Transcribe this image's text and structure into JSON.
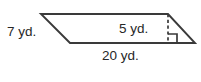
{
  "figure": {
    "kind": "parallelogram-with-height",
    "stroke_color": "#3a3a3a",
    "text_color": "#272727",
    "background_color": "#ffffff",
    "labels": {
      "left_side": "7 yd.",
      "height": "5 yd.",
      "base": "20 yd."
    },
    "icons": {
      "right_angle_marker": "right-angle-icon",
      "height_line": "dashed-height-line-icon"
    },
    "geometry": {
      "top_left": [
        41,
        14
      ],
      "top_right": [
        168,
        14
      ],
      "bottom_right": [
        195,
        43
      ],
      "bottom_left": [
        70,
        43
      ],
      "height_line_x": 168,
      "height_line_top_y": 14,
      "height_line_bottom_y": 43,
      "right_angle_size": 9
    }
  }
}
